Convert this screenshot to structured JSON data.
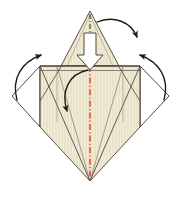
{
  "figure": {
    "background_color": "#ffffff",
    "width": 181,
    "height": 198
  },
  "palette": {
    "paper_fill": "#e9e3ca",
    "paper_fill_light": "#f0ecd8",
    "paper_stroke": "#4a4233",
    "thin_crease_stroke": "#7d7665",
    "outline_stroke": "#3a362e",
    "center_line_red": "#e8432a",
    "center_line_dark": "#2b2720",
    "arrow_stroke": "#1d1a15",
    "hollow_arrow_fill": "#ffffff",
    "hollow_arrow_stroke": "#3a362e"
  },
  "shapes": {
    "top_triangle": {
      "name": "top-point-flap",
      "apex": [
        90,
        11
      ],
      "left_base": [
        61,
        66
      ],
      "right_base": [
        119,
        66
      ],
      "fill": "#e9e3ca"
    },
    "main_body": {
      "name": "main-square-panel",
      "top_left": [
        40,
        66
      ],
      "top_right": [
        140,
        66
      ],
      "bottom_right": [
        140,
        127
      ],
      "bottom_tip": [
        90,
        181
      ],
      "bottom_left": [
        40,
        127
      ],
      "fill": "#e9e3ca"
    },
    "left_wing": {
      "name": "left-side-flap",
      "hinge_top": [
        40,
        66
      ],
      "outer_tip": [
        12,
        96
      ],
      "hinge_bottom": [
        40,
        127
      ],
      "fill": "none"
    },
    "right_wing": {
      "name": "right-side-flap",
      "hinge_top": [
        140,
        66
      ],
      "outer_tip": [
        169,
        96
      ],
      "hinge_bottom": [
        140,
        127
      ],
      "fill": "none"
    },
    "inner_creases": [
      {
        "name": "left-inner-diagonal",
        "from": [
          40,
          66
        ],
        "to": [
          90,
          181
        ]
      },
      {
        "name": "right-inner-diagonal",
        "from": [
          140,
          66
        ],
        "to": [
          90,
          181
        ]
      },
      {
        "name": "left-v-crease",
        "from": [
          56,
          66
        ],
        "to": [
          90,
          181
        ]
      },
      {
        "name": "right-v-crease",
        "from": [
          124,
          66
        ],
        "to": [
          90,
          181
        ]
      },
      {
        "name": "left-upper-fold",
        "from": [
          61,
          66
        ],
        "to": [
          40,
          101
        ]
      },
      {
        "name": "right-upper-fold",
        "from": [
          119,
          66
        ],
        "to": [
          140,
          101
        ]
      },
      {
        "name": "left-vertical-edge",
        "from": [
          57,
          66
        ],
        "to": [
          57,
          127
        ]
      },
      {
        "name": "right-vertical-edge",
        "from": [
          123,
          66
        ],
        "to": [
          123,
          127
        ]
      },
      {
        "name": "top-inner-rail",
        "from": [
          40,
          70
        ],
        "to": [
          140,
          70
        ]
      }
    ]
  },
  "center_lines": {
    "upper_axis": {
      "name": "top-flap-center-axis",
      "from": [
        90,
        14
      ],
      "to": [
        90,
        40
      ],
      "color": "#2b2720",
      "style": "dash-dot"
    },
    "body_axis": {
      "name": "body-center-axis",
      "from": [
        90,
        66
      ],
      "to": [
        90,
        181
      ],
      "color": "#e8432a",
      "style": "dash-dot"
    }
  },
  "arrows": {
    "hollow_push_arrow": {
      "name": "hollow-fold-down-arrow",
      "direction": "down",
      "shaft_top": [
        90,
        33
      ],
      "tip": [
        90,
        69
      ],
      "fill": "#ffffff",
      "stroke": "#3a362e"
    },
    "curved": [
      {
        "name": "top-right-fold-arrow",
        "description": "curved arrow from top flap apex sweeping right and down",
        "path": "M 97,22 C 113,16 130,22 137,36",
        "head_at": [
          137,
          36
        ],
        "head_angle_deg": 72
      },
      {
        "name": "left-wing-fold-up-arrow",
        "description": "curved arrow from left outer wing tip sweeping up and right",
        "path": "M 17,99 C 12,78 22,62 40,56",
        "head_at": [
          40,
          56
        ],
        "head_angle_deg": -72
      },
      {
        "name": "right-wing-fold-up-arrow",
        "description": "curved arrow from right outer wing tip sweeping up and left",
        "path": "M 164,99 C 169,78 159,62 141,56",
        "head_at": [
          141,
          56
        ],
        "head_angle_deg": 252
      },
      {
        "name": "inner-flap-fold-left-arrow",
        "description": "curved arrow inside body from centre top curving down to the left",
        "path": "M 87,71 C 68,74 62,92 67,110",
        "head_at": [
          67,
          110
        ],
        "head_angle_deg": 105
      }
    ]
  }
}
